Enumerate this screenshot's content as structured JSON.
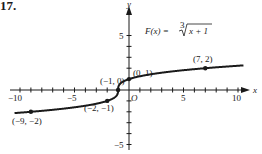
{
  "problem": {
    "number": "17."
  },
  "chart_data": {
    "type": "line",
    "function": "F(x) = cube_root(x + 1)",
    "xlabel": "x",
    "ylabel": "y",
    "xlim": [
      -10.5,
      10.5
    ],
    "ylim": [
      -5.5,
      5.5
    ],
    "x_tick_labels": [
      "-10",
      "-5",
      "5",
      "10"
    ],
    "y_tick_labels": [
      "5",
      "-5"
    ],
    "x_ticks": [
      -10,
      -9,
      -8,
      -7,
      -6,
      -5,
      -4,
      -3,
      -2,
      -1,
      1,
      2,
      3,
      4,
      5,
      6,
      7,
      8,
      9,
      10
    ],
    "y_ticks": [
      -5,
      -4,
      -3,
      -2,
      -1,
      1,
      2,
      3,
      4,
      5
    ],
    "origin_label": "O",
    "grid": false,
    "labeled_points": [
      {
        "x": -9,
        "y": -2,
        "label": "(−9, −2)"
      },
      {
        "x": -2,
        "y": -1,
        "label": "(−2, −1)"
      },
      {
        "x": -1,
        "y": 0,
        "label": "(−1, 0)"
      },
      {
        "x": 0,
        "y": 1,
        "label": "(0, 1)"
      },
      {
        "x": 7,
        "y": 2,
        "label": "(7, 2)"
      }
    ],
    "series": [
      {
        "name": "F(x)",
        "color": "#1a1a1a"
      }
    ]
  },
  "labels": {
    "x_axis": "x",
    "y_axis": "y",
    "origin": "O",
    "formula_lhs": "F(x) = ",
    "formula_root_index": "3",
    "formula_radicand": "x + 1",
    "tick_x_neg10": "−10",
    "tick_x_neg5": "−5",
    "tick_x_5": "5",
    "tick_x_10": "10",
    "tick_y_5": "5",
    "tick_y_neg5": "−5",
    "pt_neg9": "(−9, −2)",
    "pt_neg2": "(−2, −1)",
    "pt_neg1": "(−1, 0)",
    "pt_0": "(0, 1)",
    "pt_7": "(7, 2)"
  }
}
